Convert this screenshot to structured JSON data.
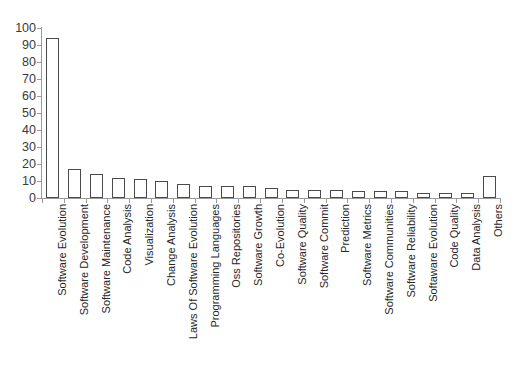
{
  "chart_data": {
    "type": "bar",
    "title": "",
    "subtitle": "",
    "xlabel": "",
    "ylabel": "",
    "ylim": [
      0,
      100
    ],
    "y_ticks": [
      0,
      10,
      20,
      30,
      40,
      50,
      60,
      70,
      80,
      90,
      100
    ],
    "grid": false,
    "legend": "none",
    "bar_fill_color": "#ffffff",
    "bar_edge_color": "#4a4a4a",
    "axis_color": "#9a9a9a",
    "label_color": "#262626",
    "categories": [
      "Software Evolution",
      "Software Development",
      "Software Maintenance",
      "Code Analysis",
      "Visualization",
      "Change Analysis",
      "Laws Of Software Evolution",
      "Programming Languages",
      "Oss Repositories",
      "Software Growth",
      "Co-Evolution",
      "Software Quality",
      "Software Commit",
      "Prediction",
      "Software Metrics",
      "Software Communities",
      "Software Reliability",
      "Softaware Evolution",
      "Code Quality",
      "Data Analysis",
      "Others"
    ],
    "values": [
      94,
      17,
      14,
      12,
      11,
      10,
      8,
      7,
      7,
      7,
      6,
      5,
      5,
      5,
      4,
      4,
      4,
      3,
      3,
      3,
      13
    ]
  },
  "top_artifact": {
    "fragments": [
      "·",
      "·",
      "·"
    ]
  }
}
